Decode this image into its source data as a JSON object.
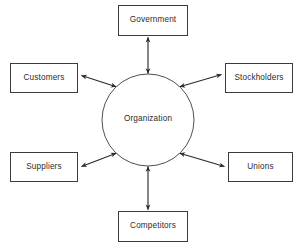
{
  "diagram": {
    "type": "hub-and-spoke",
    "hub": {
      "name": "organization-hub",
      "label": "Organization",
      "shape": "circle",
      "center": {
        "x": 148,
        "y": 120
      },
      "radius": 46
    },
    "nodes": [
      {
        "id": "government",
        "label": "Government",
        "shape": "rectangle",
        "position": "top",
        "box": {
          "x": 118,
          "y": 5,
          "w": 70,
          "h": 31
        }
      },
      {
        "id": "stockholders",
        "label": "Stockholders",
        "shape": "rectangle",
        "position": "upper-right",
        "box": {
          "x": 225,
          "y": 63,
          "w": 68,
          "h": 30
        }
      },
      {
        "id": "unions",
        "label": "Unions",
        "shape": "rectangle",
        "position": "lower-right",
        "box": {
          "x": 228,
          "y": 152,
          "w": 65,
          "h": 30
        }
      },
      {
        "id": "competitors",
        "label": "Competitors",
        "shape": "rectangle",
        "position": "bottom",
        "box": {
          "x": 118,
          "y": 211,
          "w": 70,
          "h": 31
        }
      },
      {
        "id": "suppliers",
        "label": "Suppliers",
        "shape": "rectangle",
        "position": "lower-left",
        "box": {
          "x": 10,
          "y": 152,
          "w": 68,
          "h": 30
        }
      },
      {
        "id": "customers",
        "label": "Customers",
        "shape": "rectangle",
        "position": "upper-left",
        "box": {
          "x": 10,
          "y": 63,
          "w": 68,
          "h": 30
        }
      }
    ],
    "connectors": [
      {
        "id": "link-government",
        "from": "organization-hub",
        "to": "government",
        "arrowheads": "both",
        "style": "solid"
      },
      {
        "id": "link-stockholders",
        "from": "organization-hub",
        "to": "stockholders",
        "arrowheads": "both",
        "style": "solid"
      },
      {
        "id": "link-unions",
        "from": "organization-hub",
        "to": "unions",
        "arrowheads": "both",
        "style": "solid"
      },
      {
        "id": "link-competitors",
        "from": "organization-hub",
        "to": "competitors",
        "arrowheads": "both",
        "style": "solid"
      },
      {
        "id": "link-suppliers",
        "from": "organization-hub",
        "to": "suppliers",
        "arrowheads": "both",
        "style": "solid"
      },
      {
        "id": "link-customers",
        "from": "organization-hub",
        "to": "customers",
        "arrowheads": "both",
        "style": "solid"
      }
    ],
    "colors": {
      "background": "#ffffff",
      "stroke": "#3b3b3b",
      "connector": "#2b2b2b",
      "text": "#2b2b2b"
    }
  }
}
